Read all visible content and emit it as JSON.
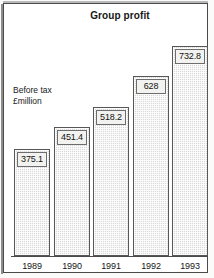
{
  "figure": {
    "title": "Group profit",
    "axis_note_line1": "Before tax",
    "axis_note_line2": "£million"
  },
  "colors": {
    "frame_border": "#4a4a4a",
    "bar_fill": "#d9d9d9",
    "bar_border": "#575757",
    "label_box_fill": "#f2f2f0",
    "text": "#121212",
    "page_background": "#ffffff"
  },
  "chart_data": {
    "type": "bar",
    "title": "Group profit",
    "xlabel": "",
    "ylabel": "Before tax £million",
    "categories": [
      "1989",
      "1990",
      "1991",
      "1992",
      "1993"
    ],
    "values": [
      375.1,
      451.4,
      518.2,
      628,
      732.8
    ],
    "value_labels": [
      "375.1",
      "451.4",
      "518.2",
      "628",
      "732.8"
    ],
    "ylim": [
      0,
      800
    ],
    "grid": false,
    "legend": "none",
    "series": [
      {
        "name": "Profit before tax (£million)",
        "values": [
          375.1,
          451.4,
          518.2,
          628,
          732.8
        ]
      }
    ],
    "annotations": [
      "Before tax",
      "£million"
    ]
  }
}
